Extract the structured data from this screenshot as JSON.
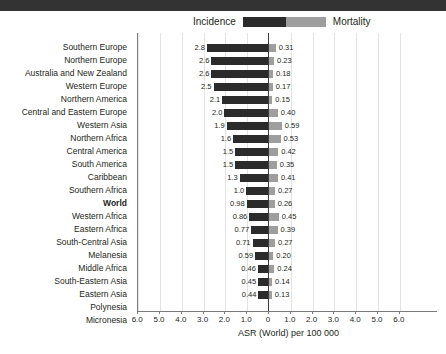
{
  "banner": {
    "name": "top-black-banner",
    "color": "#333333"
  },
  "legend": {
    "incidence_label": "Incidence",
    "mortality_label": "Mortality",
    "incidence_color": "#2b2b2b",
    "mortality_color": "#9e9e9e"
  },
  "axis": {
    "title": "ASR (World) per 100 000",
    "tick_labels": [
      "6.0",
      "5.0",
      "4.0",
      "3.0",
      "2.0",
      "1.0",
      "0",
      "1.0",
      "2.0",
      "3.0",
      "4.0",
      "5.0",
      "6.0"
    ],
    "tick_values": [
      -6,
      -5,
      -4,
      -3,
      -2,
      -1,
      0,
      1,
      2,
      3,
      4,
      5,
      6
    ]
  },
  "chart_data": {
    "type": "bar",
    "orientation": "diverging-horizontal",
    "title": "",
    "xlabel": "ASR (World) per 100 000",
    "ylabel": "",
    "xlim": [
      -6,
      6
    ],
    "grid": true,
    "legend_position": "top-center",
    "categories": [
      "Southern Europe",
      "Northern Europe",
      "Australia and New Zealand",
      "Western Europe",
      "Northern America",
      "Central and Eastern Europe",
      "Western Asia",
      "Northern Africa",
      "Central America",
      "South America",
      "Caribbean",
      "Southern Africa",
      "World",
      "Western Africa",
      "Eastern Africa",
      "South-Central Asia",
      "Melanesia",
      "Middle Africa",
      "South-Eastern Asia",
      "Eastern Asia",
      "Polynesia",
      "Micronesia"
    ],
    "series": [
      {
        "name": "Incidence",
        "color": "#2b2b2b",
        "side": "left",
        "values": [
          2.8,
          2.6,
          2.6,
          2.5,
          2.1,
          2.0,
          1.9,
          1.6,
          1.5,
          1.5,
          1.3,
          1.0,
          0.98,
          0.86,
          0.77,
          0.71,
          0.59,
          0.46,
          0.45,
          0.44,
          null,
          null
        ],
        "labels": [
          "2.8",
          "2.6",
          "2.6",
          "2.5",
          "2.1",
          "2.0",
          "1.9",
          "1.6",
          "1.5",
          "1.5",
          "1.3",
          "1.0",
          "0.98",
          "0.86",
          "0.77",
          "0.71",
          "0.59",
          "0.46",
          "0.45",
          "0.44",
          "",
          ""
        ]
      },
      {
        "name": "Mortality",
        "color": "#9e9e9e",
        "side": "right",
        "values": [
          0.31,
          0.23,
          0.18,
          0.17,
          0.15,
          0.4,
          0.59,
          0.53,
          0.42,
          0.35,
          0.41,
          0.27,
          0.26,
          0.45,
          0.39,
          0.27,
          0.2,
          0.24,
          0.14,
          0.13,
          null,
          null
        ],
        "labels": [
          "0.31",
          "0.23",
          "0.18",
          "0.17",
          "0.15",
          "0.40",
          "0.59",
          "0.53",
          "0.42",
          "0.35",
          "0.41",
          "0.27",
          "0.26",
          "0.45",
          "0.39",
          "0.27",
          "0.20",
          "0.24",
          "0.14",
          "0.13",
          "",
          ""
        ]
      }
    ],
    "bold_categories": [
      "World"
    ]
  }
}
